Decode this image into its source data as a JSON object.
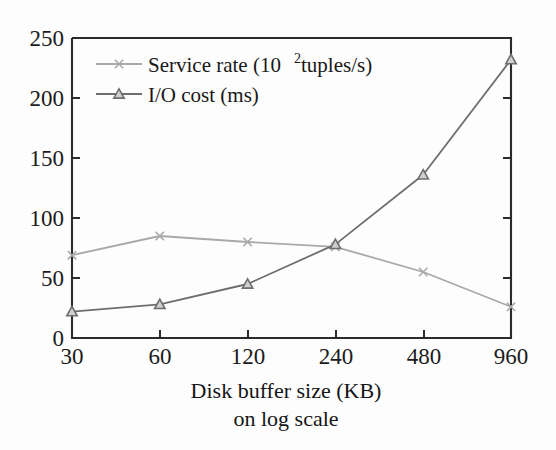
{
  "chart_data": {
    "type": "line",
    "title": "",
    "xlabel": "Disk buffer size (KB)",
    "xlabel_line2": "on log scale",
    "ylabel": "",
    "x_scale": "log",
    "categories": [
      "30",
      "60",
      "120",
      "240",
      "480",
      "960"
    ],
    "x": [
      30,
      60,
      120,
      240,
      480,
      960
    ],
    "xtick_labels": [
      "30",
      "60",
      "120",
      "240",
      "480",
      "960"
    ],
    "ytick_labels": [
      "0",
      "50",
      "100",
      "150",
      "200",
      "250"
    ],
    "yticks": [
      0,
      50,
      100,
      150,
      200,
      250
    ],
    "ylim": [
      0,
      250
    ],
    "grid": false,
    "legend_position": "top-left inside",
    "series": [
      {
        "name": "Service rate (10",
        "name_sup": "2",
        "name_tail": " tuples/s)",
        "full_name": "Service rate (10² tuples/s)",
        "marker": "x",
        "color": "#a9a9a9",
        "values": [
          69,
          85,
          80,
          76,
          55,
          26
        ]
      },
      {
        "name": "I/O cost (ms)",
        "full_name": "I/O cost (ms)",
        "marker": "triangle",
        "color": "#6e6e6e",
        "values": [
          22,
          28,
          45,
          78,
          136,
          232
        ]
      }
    ]
  },
  "colors": {
    "axis": "#2b2b2b",
    "series_1": "#a9a9a9",
    "series_2": "#6e6e6e",
    "background": "#fdfdfd",
    "text": "#1a1a1a"
  }
}
